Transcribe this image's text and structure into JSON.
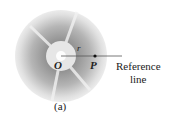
{
  "figure": {
    "labels": {
      "radius": "r",
      "origin": "O",
      "point": "P",
      "reference_line_1": "Reference",
      "reference_line_2": "line",
      "caption": "(a)"
    },
    "colors": {
      "disc_outer": "#e4e4e4",
      "disc_mid": "#9a9a9a",
      "hub": "#e8e8e8",
      "line": "#555555"
    }
  }
}
